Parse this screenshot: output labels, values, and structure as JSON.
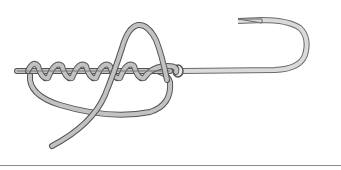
{
  "diagram": {
    "elements": [
      "standing-line",
      "line-wraps",
      "hook-eye",
      "hook-shank",
      "hook-bend",
      "hook-point",
      "tag-end-loop",
      "tag-end"
    ],
    "wrap_count": 5,
    "colors": {
      "line_fill": "#bdbdbd",
      "line_outline": "#555555",
      "hook_fill": "#d4d4d4",
      "rule": "#8a8a8a",
      "background": "#ffffff"
    }
  }
}
